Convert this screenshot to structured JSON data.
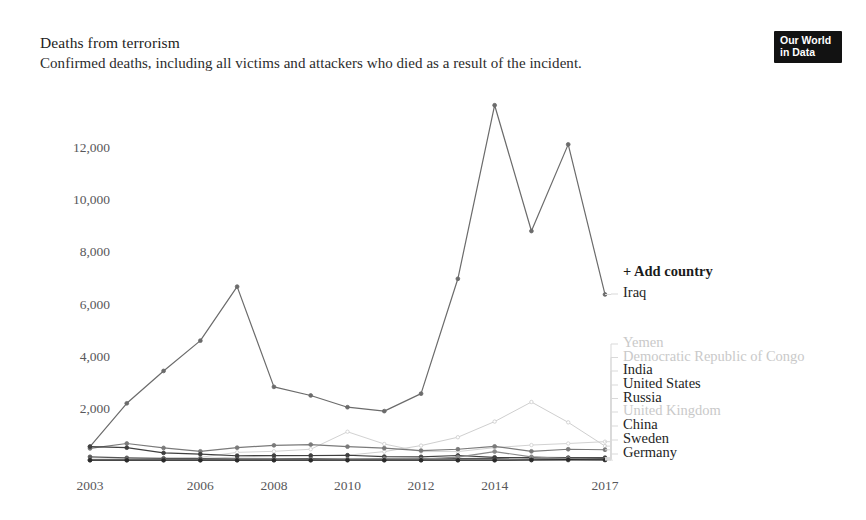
{
  "header": {
    "title": "Deaths from terrorism",
    "subtitle": "Confirmed deaths, including all victims and attackers who died as a result of the incident."
  },
  "logo": {
    "line1": "Our World",
    "line2": "in Data"
  },
  "controls": {
    "add_country_label": "+ Add country"
  },
  "colors": {
    "iraq": "#6b6b6b",
    "yemen": "#cfcfcf",
    "drc": "#d2d2d2",
    "india": "#7a7a7a",
    "united_states": "#565656",
    "russia": "#3f3f3f",
    "united_kingdom": "#d8d8d8",
    "china": "#8a8a8a",
    "sweden": "#9a9a9a",
    "germany": "#2a2a2a",
    "axis_text": "#58585a",
    "legend_strong": "#242424",
    "legend_faint": "#c9c9c9",
    "connector": "#d9d9d9"
  },
  "chart_data": {
    "type": "line",
    "title": "Deaths from terrorism",
    "subtitle": "Confirmed deaths, including all victims and attackers who died as a result of the incident.",
    "xlabel": "",
    "ylabel": "",
    "x": [
      2003,
      2004,
      2005,
      2006,
      2007,
      2008,
      2009,
      2010,
      2011,
      2012,
      2013,
      2014,
      2015,
      2016,
      2017
    ],
    "xlim": [
      2003,
      2017
    ],
    "ylim": [
      0,
      13600
    ],
    "xticks": [
      2003,
      2006,
      2008,
      2010,
      2012,
      2014,
      2017
    ],
    "xtick_labels": [
      "2003",
      "2006",
      "2008",
      "2010",
      "2012",
      "2014",
      "2017"
    ],
    "yticks": [
      2000,
      4000,
      6000,
      8000,
      10000,
      12000
    ],
    "ytick_labels": [
      "2,000",
      "4,000",
      "6,000",
      "8,000",
      "10,000",
      "12,000"
    ],
    "grid": false,
    "legend_position": "right",
    "series": [
      {
        "name": "Iraq",
        "color": "#6b6b6b",
        "emphasis": "strong",
        "values": [
          520,
          2180,
          3420,
          4580,
          6650,
          2810,
          2480,
          2030,
          1880,
          2550,
          6950,
          13600,
          8780,
          12100,
          6350
        ]
      },
      {
        "name": "Yemen",
        "color": "#cfcfcf",
        "emphasis": "faint",
        "values": [
          30,
          45,
          60,
          70,
          120,
          140,
          160,
          190,
          330,
          560,
          880,
          1480,
          2230,
          1450,
          540
        ]
      },
      {
        "name": "Democratic Republic of Congo",
        "color": "#d2d2d2",
        "emphasis": "faint",
        "values": [
          40,
          50,
          70,
          110,
          300,
          340,
          420,
          1090,
          620,
          330,
          330,
          480,
          580,
          640,
          710
        ]
      },
      {
        "name": "India",
        "color": "#7a7a7a",
        "emphasis": "strong",
        "values": [
          450,
          640,
          470,
          340,
          480,
          570,
          600,
          520,
          460,
          370,
          420,
          530,
          340,
          420,
          400
        ]
      },
      {
        "name": "United States",
        "color": "#565656",
        "emphasis": "strong",
        "values": [
          130,
          90,
          70,
          60,
          50,
          50,
          60,
          40,
          40,
          50,
          60,
          70,
          110,
          100,
          100
        ]
      },
      {
        "name": "Russia",
        "color": "#3f3f3f",
        "emphasis": "strong",
        "values": [
          520,
          480,
          280,
          230,
          170,
          180,
          180,
          190,
          140,
          130,
          180,
          110,
          90,
          80,
          70
        ]
      },
      {
        "name": "United Kingdom",
        "color": "#d8d8d8",
        "emphasis": "faint",
        "values": [
          20,
          20,
          60,
          20,
          20,
          10,
          10,
          10,
          10,
          10,
          10,
          10,
          20,
          20,
          40
        ]
      },
      {
        "name": "China",
        "color": "#8a8a8a",
        "emphasis": "strong",
        "values": [
          10,
          10,
          10,
          10,
          10,
          20,
          30,
          40,
          60,
          40,
          120,
          330,
          130,
          60,
          30
        ]
      },
      {
        "name": "Sweden",
        "color": "#9a9a9a",
        "emphasis": "strong",
        "values": [
          0,
          0,
          0,
          0,
          0,
          0,
          0,
          10,
          0,
          0,
          0,
          0,
          0,
          0,
          10
        ]
      },
      {
        "name": "Germany",
        "color": "#2a2a2a",
        "emphasis": "strong",
        "values": [
          0,
          0,
          0,
          0,
          0,
          0,
          0,
          0,
          0,
          0,
          0,
          0,
          10,
          20,
          10
        ]
      }
    ]
  }
}
